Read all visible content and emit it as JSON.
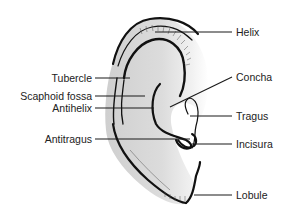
{
  "figure": {
    "labels_left": [
      {
        "id": "tubercle",
        "text": "Tubercle"
      },
      {
        "id": "scaphoid-fossa",
        "text": "Scaphoid fossa"
      },
      {
        "id": "antihelix",
        "text": "Antihelix"
      },
      {
        "id": "antitragus",
        "text": "Antitragus"
      }
    ],
    "labels_right": [
      {
        "id": "helix",
        "text": "Helix"
      },
      {
        "id": "concha",
        "text": "Concha"
      },
      {
        "id": "tragus",
        "text": "Tragus"
      },
      {
        "id": "incisura",
        "text": "Incisura"
      },
      {
        "id": "lobule",
        "text": "Lobule"
      }
    ],
    "colors": {
      "ear_fill": "#d9d9d9",
      "ear_shade": "#c4c4c4",
      "outline": "#111111",
      "text": "#222222",
      "background": "#ffffff"
    }
  }
}
